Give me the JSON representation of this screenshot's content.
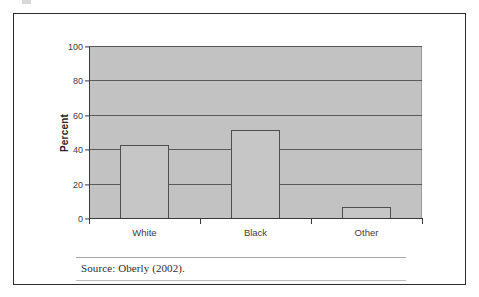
{
  "figure": {
    "source_note": "Source: Oberly (2002)."
  },
  "chart_data": {
    "type": "bar",
    "title": "",
    "xlabel": "",
    "ylabel": "Percent",
    "categories": [
      "White",
      "Black",
      "Other"
    ],
    "values": [
      43,
      52,
      7
    ],
    "ylim": [
      0,
      100
    ],
    "yticks": [
      0,
      20,
      40,
      60,
      80,
      100
    ],
    "ytick_labels": [
      "0",
      "20",
      "40",
      "60",
      "80",
      "100"
    ],
    "grid": true,
    "grid_axis": "y",
    "legend": false,
    "series": [
      {
        "name": "Percent",
        "values": [
          43,
          52,
          7
        ]
      }
    ]
  },
  "style": {
    "plot_background": "#c2c2c2",
    "bar_fill": "#c6c6c6",
    "bar_outline": "#4f4f4f",
    "gridline_color": "#595959",
    "axis_color": "#3a3a3a",
    "frame_color": "#2b2b2b",
    "text_color": "#3d3d3d"
  }
}
